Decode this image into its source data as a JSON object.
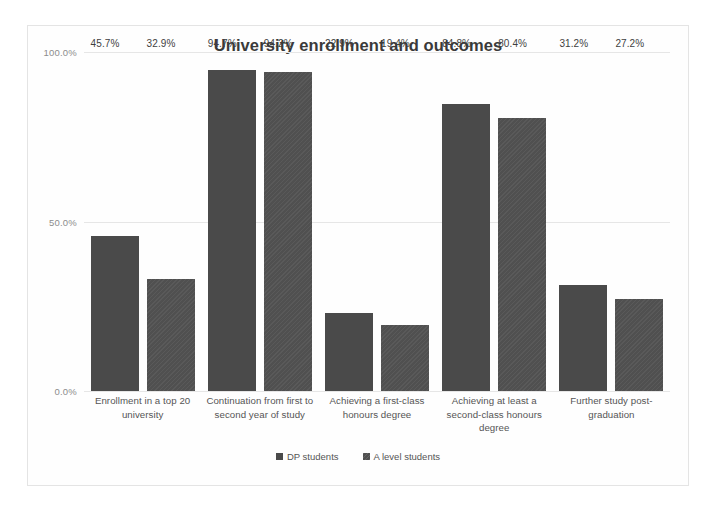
{
  "chart_data": {
    "type": "bar",
    "title": "University enrollment and outcomes",
    "xlabel": "",
    "ylabel": "",
    "ylim": [
      0,
      100
    ],
    "yticks": [
      "0.0%",
      "50.0%",
      "100.0%"
    ],
    "ytick_values": [
      0,
      50,
      100
    ],
    "grid": true,
    "legend_position": "bottom",
    "value_suffix": "%",
    "categories": [
      "Enrollment in a top 20 university",
      "Continuation from first to second year of study",
      "Achieving a first-class honours degree",
      "Achieving at least a second-class honours degree",
      "Further study post-graduation"
    ],
    "series": [
      {
        "name": "DP students",
        "color": "#4a4a4a",
        "values": [
          45.7,
          94.7,
          22.9,
          84.8,
          31.2
        ],
        "labels": [
          "45.7%",
          "94.7%",
          "22.9%",
          "84.8%",
          "31.2%"
        ]
      },
      {
        "name": "A level students",
        "color": "#505050",
        "values": [
          32.9,
          94.2,
          19.4,
          80.4,
          27.2
        ],
        "labels": [
          "32.9%",
          "94.2%",
          "19.4%",
          "80.4%",
          "27.2%"
        ]
      }
    ]
  }
}
